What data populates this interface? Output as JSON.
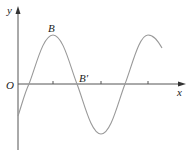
{
  "diagram": {
    "type": "sinusoidal-graph",
    "axes": {
      "x_label": "x",
      "y_label": "y",
      "origin_label": "O"
    },
    "points": [
      {
        "name": "B",
        "label": "B",
        "description": "first crest"
      },
      {
        "name": "B-prime",
        "label": "B′",
        "description": "zero crossing after crest"
      }
    ],
    "colors": {
      "axis": "#555555",
      "curve": "#999999",
      "text": "#222222",
      "background": "#ffffff"
    }
  }
}
